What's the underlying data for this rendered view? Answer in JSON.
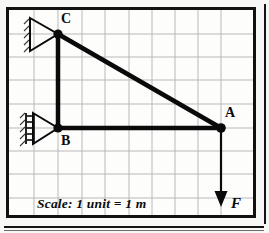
{
  "figure": {
    "type": "statics-truss-diagram",
    "top_cut_text": "",
    "scale_note": "Scale: 1 unit = 1 m",
    "grid": {
      "unit_px": 23.2,
      "cols": 10,
      "rows": 9,
      "line_color": "#b9b9b9",
      "background": "#fdfdfc"
    },
    "frame": {
      "border_color": "#111111",
      "border_width_px": 3
    },
    "member_color": "#0a0a0a",
    "nodes": [
      {
        "id": "A",
        "label": "A",
        "x": 212,
        "y": 118,
        "label_dx": 6,
        "label_dy": -20,
        "support": "none"
      },
      {
        "id": "B",
        "label": "B",
        "x": 49,
        "y": 118,
        "label_dx": 3,
        "label_dy": 6,
        "support": "pin-hatched"
      },
      {
        "id": "C",
        "label": "C",
        "x": 49,
        "y": 24,
        "label_dx": 4,
        "label_dy": -20,
        "support": "pin-hatched"
      }
    ],
    "members": [
      {
        "name": "member-CB",
        "from": "C",
        "to": "B"
      },
      {
        "name": "member-BA",
        "from": "B",
        "to": "A"
      },
      {
        "name": "member-CA",
        "from": "C",
        "to": "A"
      }
    ],
    "load": {
      "label": "F",
      "direction": "down",
      "at_node": "A",
      "tail_x": 212,
      "tail_y": 118,
      "head_x": 212,
      "head_y": 196,
      "label_x": 222,
      "label_y": 196
    },
    "colors": {
      "ink": "#0a0a0a",
      "grid": "#b9b9b9",
      "paper": "#fdfdfc",
      "border": "#111111"
    }
  }
}
